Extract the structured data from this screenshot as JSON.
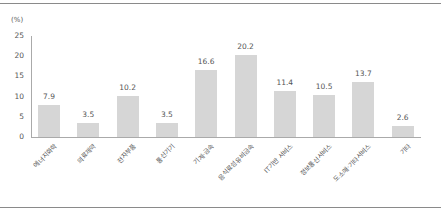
{
  "chart_data": {
    "type": "bar",
    "title": "",
    "xlabel": "",
    "ylabel": "(%)",
    "ylim": [
      0,
      25
    ],
    "yticks": [
      0,
      5,
      10,
      15,
      20,
      25
    ],
    "grid": false,
    "legend": null,
    "categories": [
      "에너지화학",
      "의료제약",
      "전자부품",
      "통신기기",
      "기계·금속",
      "음식료섬유비금속",
      "IT기반 서비스",
      "정보통신서비스",
      "도소매·기타서비스",
      "기타"
    ],
    "values": [
      7.9,
      3.5,
      10.2,
      3.5,
      16.6,
      20.2,
      11.4,
      10.5,
      13.7,
      2.6
    ],
    "bar_color": "#d6d6d6"
  },
  "labels": {
    "unit": "(%)",
    "yticks": [
      "25",
      "20",
      "15",
      "10",
      "5",
      "0"
    ],
    "values": [
      "7.9",
      "3.5",
      "10.2",
      "3.5",
      "16.6",
      "20.2",
      "11.4",
      "10.5",
      "13.7",
      "2.6"
    ]
  }
}
